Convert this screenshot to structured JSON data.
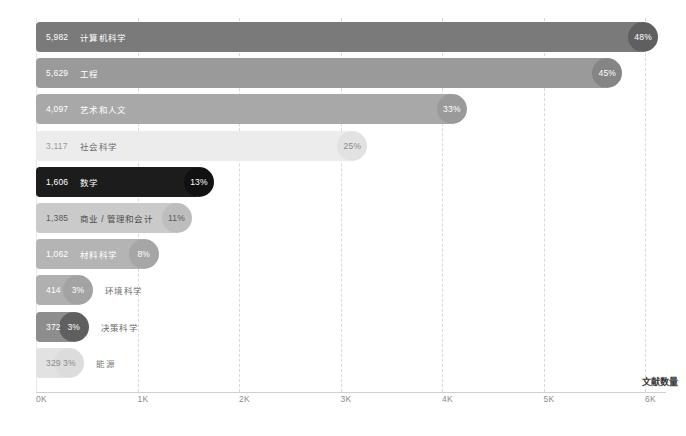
{
  "chart_data": {
    "type": "bar",
    "orientation": "horizontal",
    "title": "",
    "xlabel": "文献数量",
    "ylabel": "",
    "xlim": [
      0,
      6400
    ],
    "xticks": [
      "0K",
      "1K",
      "2K",
      "3K",
      "4K",
      "5K",
      "6K"
    ],
    "xtick_values": [
      0,
      1000,
      2000,
      3000,
      4000,
      5000,
      6000
    ],
    "grid": true,
    "legend": "none",
    "categories": [
      "计算机科学",
      "工程",
      "艺术和人文",
      "社会科学",
      "数学",
      "商业 / 管理和会计",
      "材料科学",
      "环境科学",
      "决策科学",
      "能源"
    ],
    "values": [
      5982,
      5629,
      4097,
      3117,
      1606,
      1385,
      1062,
      414,
      372,
      329
    ],
    "value_labels": [
      "5,982",
      "5,629",
      "4,097",
      "3,117",
      "1,606",
      "1,385",
      "1,062",
      "414",
      "372",
      "329"
    ],
    "percent_labels": [
      "48%",
      "45%",
      "33%",
      "25%",
      "13%",
      "11%",
      "8%",
      "3%",
      "3%",
      "3%"
    ],
    "percent_values": [
      48,
      45,
      33,
      25,
      13,
      11,
      8,
      3,
      3,
      3
    ],
    "bar_colors": [
      "#7a7a7a",
      "#9a9a9a",
      "#a8a8a8",
      "#ececec",
      "#1c1c1c",
      "#cacaca",
      "#b4b4b4",
      "#b0b0b0",
      "#8d8d8d",
      "#e2e2e2"
    ],
    "cap_colors": [
      "#5f5f5f",
      "#858585",
      "#9a9a9a",
      "#e2e2e2",
      "#111111",
      "#bdbdbd",
      "#a6a6a6",
      "#a3a3a3",
      "#5f5f5f",
      "#dcdcdc"
    ],
    "value_text_colors": [
      "#ffffff",
      "#ffffff",
      "#ffffff",
      "#9a9a9a",
      "#ffffff",
      "#5a5a5a",
      "#ffffff",
      "#ffffff",
      "#ffffff",
      "#8a8a8a"
    ],
    "label_text_colors": [
      "#ffffff",
      "#ffffff",
      "#ffffff",
      "#6a6a6a",
      "#ffffff",
      "#4a4a4a",
      "#ffffff",
      "#6a6a6a",
      "#6a6a6a",
      "#7a7a7a"
    ],
    "percent_text_colors": [
      "#ffffff",
      "#ffffff",
      "#ffffff",
      "#8a8a8a",
      "#ffffff",
      "#5a5a5a",
      "#ffffff",
      "#ffffff",
      "#ffffff",
      "#8a8a8a"
    ],
    "label_inside": [
      true,
      true,
      true,
      true,
      true,
      true,
      true,
      false,
      false,
      false
    ]
  }
}
